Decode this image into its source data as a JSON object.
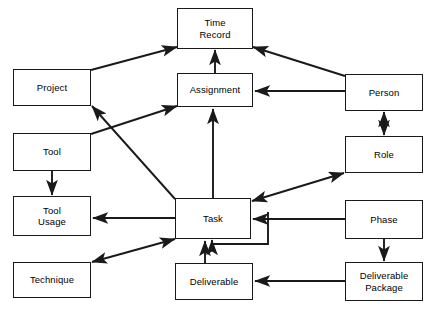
{
  "diagram": {
    "background_color": "#ffffff",
    "line_color": "#1a1a1a",
    "text_color": "#000000",
    "width": 431,
    "height": 315,
    "nodes": [
      {
        "id": "time_record",
        "label": "Time\nRecord",
        "x": 177,
        "y": 8,
        "w": 76,
        "h": 41
      },
      {
        "id": "project",
        "label": "Project",
        "x": 13,
        "y": 69,
        "w": 78,
        "h": 37
      },
      {
        "id": "assignment",
        "label": "Assignment",
        "x": 177,
        "y": 73,
        "w": 76,
        "h": 34
      },
      {
        "id": "person",
        "label": "Person",
        "x": 345,
        "y": 74,
        "w": 78,
        "h": 37
      },
      {
        "id": "tool",
        "label": "Tool",
        "x": 13,
        "y": 133,
        "w": 78,
        "h": 38
      },
      {
        "id": "role",
        "label": "Role",
        "x": 345,
        "y": 136,
        "w": 78,
        "h": 37
      },
      {
        "id": "tool_usage",
        "label": "Tool\nUsage",
        "x": 13,
        "y": 196,
        "w": 78,
        "h": 40
      },
      {
        "id": "task",
        "label": "Task",
        "x": 175,
        "y": 198,
        "w": 76,
        "h": 41
      },
      {
        "id": "phase",
        "label": "Phase",
        "x": 345,
        "y": 200,
        "w": 78,
        "h": 39
      },
      {
        "id": "technique",
        "label": "Technique",
        "x": 13,
        "y": 262,
        "w": 78,
        "h": 36
      },
      {
        "id": "deliverable",
        "label": "Deliverable",
        "x": 175,
        "y": 263,
        "w": 78,
        "h": 37
      },
      {
        "id": "deliverable_package",
        "label": "Deliverable\nPackage",
        "x": 345,
        "y": 262,
        "w": 78,
        "h": 39
      }
    ],
    "edges": [
      {
        "id": "project-to-time-record",
        "from": "project",
        "to": "time_record",
        "arrows": "end",
        "points": "91,70 177,47"
      },
      {
        "id": "person-to-time-record",
        "from": "person",
        "to": "time_record",
        "arrows": "end",
        "points": "345,76 253,47"
      },
      {
        "id": "assignment-to-time-record",
        "from": "assignment",
        "to": "time_record",
        "arrows": "end",
        "points": "215,73 215,50"
      },
      {
        "id": "person-to-assignment",
        "from": "person",
        "to": "assignment",
        "arrows": "end",
        "points": "345,91 255,91"
      },
      {
        "id": "tool-to-assignment",
        "from": "tool",
        "to": "assignment",
        "arrows": "end",
        "points": "91,134 177,106"
      },
      {
        "id": "task-to-project",
        "from": "task",
        "to": "project",
        "arrows": "end",
        "points": "175,199 92,106"
      },
      {
        "id": "task-to-assignment",
        "from": "task",
        "to": "assignment",
        "arrows": "end",
        "points": "213,198 213,109"
      },
      {
        "id": "person-to-role",
        "from": "person",
        "to": "role",
        "arrows": "both",
        "points": "384,112 384,135"
      },
      {
        "id": "tool-to-tool-usage",
        "from": "tool",
        "to": "tool_usage",
        "arrows": "end",
        "points": "52,171 52,195"
      },
      {
        "id": "task-to-tool-usage",
        "from": "task",
        "to": "tool_usage",
        "arrows": "end",
        "points": "175,218 93,218"
      },
      {
        "id": "task-role-association",
        "from": "task",
        "to": "role",
        "arrows": "both",
        "points": "252,201 344,173"
      },
      {
        "id": "phase-to-task",
        "from": "phase",
        "to": "task",
        "arrows": "end",
        "points": "345,219 253,219"
      },
      {
        "id": "task-self-reference",
        "from": "task",
        "to": "task",
        "arrows": "end",
        "points": "268,212 268,244 212,244 212,240"
      },
      {
        "id": "task-technique-association",
        "from": "task",
        "to": "technique",
        "arrows": "both",
        "points": "175,239 92,262"
      },
      {
        "id": "deliverable-to-task",
        "from": "deliverable",
        "to": "task",
        "arrows": "end",
        "points": "205,263 205,241"
      },
      {
        "id": "phase-to-deliverable-package",
        "from": "phase",
        "to": "deliverable_package",
        "arrows": "end",
        "points": "384,239 384,261"
      },
      {
        "id": "deliverable-package-to-deliverable",
        "from": "deliverable_package",
        "to": "deliverable",
        "arrows": "end",
        "points": "345,281 255,281"
      }
    ]
  }
}
